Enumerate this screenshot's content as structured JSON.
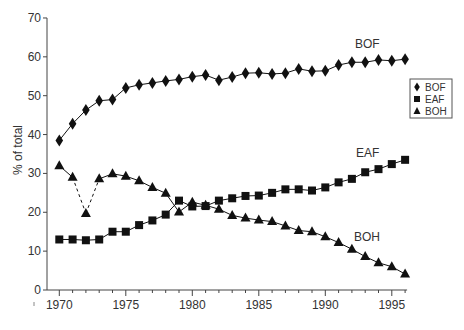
{
  "chart_data": {
    "type": "line",
    "title": "",
    "xlabel": "",
    "ylabel": "% of total",
    "xlim": [
      1970,
      1996
    ],
    "ylim": [
      0,
      70
    ],
    "x_ticks": [
      1970,
      1975,
      1980,
      1985,
      1990,
      1995
    ],
    "y_ticks": [
      0,
      10,
      20,
      30,
      40,
      50,
      60,
      70
    ],
    "grid": false,
    "legend_position": "right",
    "x": [
      1970,
      1971,
      1972,
      1973,
      1974,
      1975,
      1976,
      1977,
      1978,
      1979,
      1980,
      1981,
      1982,
      1983,
      1984,
      1985,
      1986,
      1987,
      1988,
      1989,
      1990,
      1991,
      1992,
      1993,
      1994,
      1995,
      1996
    ],
    "series": [
      {
        "name": "BOF",
        "marker": "diamond",
        "values": [
          38.5,
          42.8,
          46.3,
          48.7,
          49.0,
          52.0,
          52.8,
          53.3,
          53.8,
          54.2,
          54.9,
          55.3,
          54.0,
          54.8,
          55.8,
          55.9,
          55.6,
          55.8,
          56.9,
          56.3,
          56.4,
          57.9,
          58.6,
          58.6,
          59.2,
          59.0,
          59.4
        ],
        "label_pos": [
          355,
          48
        ]
      },
      {
        "name": "EAF",
        "marker": "square",
        "values": [
          13.0,
          13.0,
          12.8,
          13.0,
          15.0,
          15.0,
          16.7,
          17.9,
          19.4,
          23.0,
          21.5,
          21.6,
          23.0,
          23.6,
          24.2,
          24.3,
          25.0,
          25.9,
          25.9,
          25.6,
          26.4,
          27.7,
          28.6,
          30.3,
          31.1,
          32.4,
          33.5
        ],
        "label_pos": [
          356,
          157
        ]
      },
      {
        "name": "BOH",
        "marker": "triangle",
        "values": [
          32.0,
          29.0,
          19.7,
          28.6,
          29.9,
          29.3,
          28.1,
          26.4,
          24.9,
          20.1,
          22.6,
          21.8,
          20.8,
          19.2,
          18.5,
          18.0,
          17.6,
          16.5,
          15.3,
          15.0,
          13.7,
          12.2,
          10.5,
          8.6,
          7.0,
          6.0,
          4.1
        ],
        "dashed_segments": [
          [
            1971,
            1972
          ],
          [
            1972,
            1973
          ]
        ],
        "label_pos": [
          354,
          241
        ]
      }
    ]
  },
  "legend": {
    "items": [
      {
        "label": "BOF",
        "marker": "diamond"
      },
      {
        "label": "EAF",
        "marker": "square"
      },
      {
        "label": "BOH",
        "marker": "triangle"
      }
    ]
  },
  "colors": {
    "series": "#111111",
    "axis": "#444444",
    "text": "#333333"
  }
}
